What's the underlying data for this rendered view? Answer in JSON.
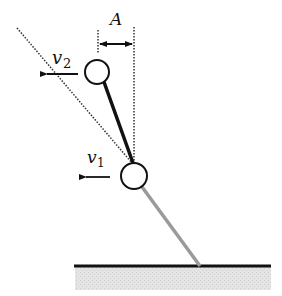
{
  "diagram": {
    "labels": {
      "amplitude": "A",
      "v2_main": "v",
      "v2_sub": "2",
      "v1_main": "v",
      "v1_sub": "1"
    },
    "colors": {
      "line": "#111111",
      "lower_rod": "#9a9a9a",
      "ground_fill": "#e2e2e2",
      "background": "#ffffff"
    },
    "elements": [
      "upper-mass-circle",
      "lower-mass-circle",
      "upper-rod-black",
      "lower-rod-gray",
      "ground-line",
      "ground-hatch",
      "dotted-vertical-reference",
      "dotted-diagonal-reference",
      "amplitude-arrow",
      "velocity-arrow-v2",
      "velocity-arrow-v1"
    ]
  }
}
